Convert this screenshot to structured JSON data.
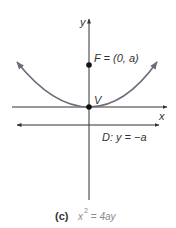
{
  "diagram": {
    "axes": {
      "x_label": "x",
      "y_label": "y"
    },
    "focus": {
      "label": "F = (0, a)"
    },
    "vertex": {
      "label": "V"
    },
    "directrix": {
      "label": "D: y = −a"
    },
    "caption": {
      "tag": "(c)",
      "eq_base": "x",
      "eq_exp": "2",
      "eq_rest": " = 4ay"
    },
    "colors": {
      "axis": "#333333",
      "parabola": "#6e6a7a",
      "point": "#111111",
      "caption_eq": "#8a8a8a"
    }
  }
}
